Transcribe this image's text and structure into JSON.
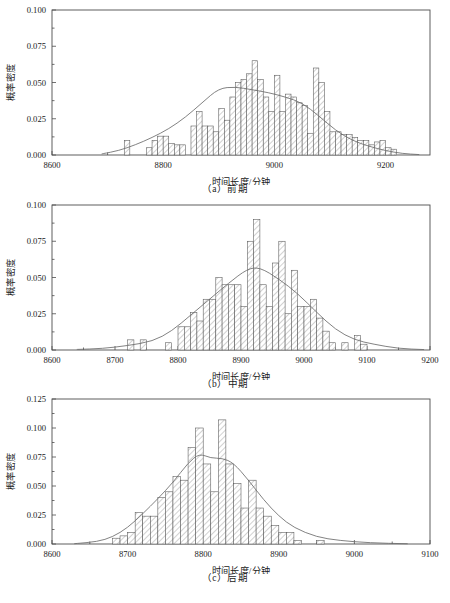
{
  "figure": {
    "background": "#ffffff",
    "line_color": "#4d4d4d",
    "bar_stroke": "#555555",
    "kde_color": "#6b6b6b"
  },
  "chart_data": [
    {
      "type": "bar",
      "id": "panel-a",
      "title": "",
      "caption": "（a）前期",
      "xlabel": "时间长度/分钟",
      "ylabel": "概率密度",
      "xlim": [
        8600,
        9280
      ],
      "ylim": [
        0.0,
        0.1
      ],
      "xticks": [
        8600,
        8800,
        9000,
        9200
      ],
      "xtick_labels": [
        "8600",
        "8800",
        "9000",
        "9200"
      ],
      "yticks": [
        0.0,
        0.025,
        0.05,
        0.075,
        0.1
      ],
      "ytick_labels": [
        "0.000",
        "0.025",
        "0.050",
        "0.075",
        "0.100"
      ],
      "grid": false,
      "legend": null,
      "bin_width": 10,
      "bin_starts": [
        8730,
        8770,
        8780,
        8790,
        8800,
        8810,
        8820,
        8830,
        8850,
        8860,
        8870,
        8880,
        8890,
        8900,
        8910,
        8920,
        8930,
        8940,
        8950,
        8960,
        8970,
        8980,
        8990,
        9000,
        9010,
        9020,
        9030,
        9040,
        9050,
        9060,
        9070,
        9080,
        9090,
        9100,
        9110,
        9120,
        9130,
        9140,
        9150,
        9160,
        9170,
        9180,
        9190,
        9200,
        9210
      ],
      "values": [
        0.01,
        0.005,
        0.01,
        0.013,
        0.013,
        0.008,
        0.007,
        0.007,
        0.02,
        0.03,
        0.02,
        0.02,
        0.016,
        0.032,
        0.024,
        0.04,
        0.05,
        0.052,
        0.056,
        0.065,
        0.052,
        0.04,
        0.03,
        0.055,
        0.03,
        0.042,
        0.04,
        0.036,
        0.034,
        0.015,
        0.06,
        0.05,
        0.03,
        0.016,
        0.016,
        0.014,
        0.014,
        0.012,
        0.01,
        0.01,
        0.007,
        0.009,
        0.01,
        0.005,
        0.004
      ],
      "kde": {
        "x": [
          8690,
          8720,
          8750,
          8780,
          8810,
          8840,
          8870,
          8900,
          8930,
          8960,
          8990,
          9020,
          9050,
          9080,
          9110,
          9140,
          9170,
          9200,
          9230,
          9260
        ],
        "y": [
          0.0008,
          0.003,
          0.007,
          0.012,
          0.018,
          0.026,
          0.036,
          0.046,
          0.047,
          0.045,
          0.043,
          0.04,
          0.036,
          0.027,
          0.017,
          0.01,
          0.006,
          0.003,
          0.001,
          0.0003
        ]
      }
    },
    {
      "type": "bar",
      "id": "panel-b",
      "title": "",
      "caption": "（b）中期",
      "xlabel": "时间长度/分钟",
      "ylabel": "概率密度",
      "xlim": [
        8600,
        9200
      ],
      "ylim": [
        0.0,
        0.1
      ],
      "xticks": [
        8600,
        8700,
        8800,
        8900,
        9000,
        9100,
        9200
      ],
      "xtick_labels": [
        "8600",
        "8700",
        "8800",
        "8900",
        "9000",
        "9100",
        "9200"
      ],
      "yticks": [
        0.0,
        0.025,
        0.05,
        0.075,
        0.1
      ],
      "ytick_labels": [
        "0.000",
        "0.025",
        "0.050",
        "0.075",
        "0.100"
      ],
      "grid": false,
      "legend": null,
      "bin_width": 10,
      "bin_starts": [
        8720,
        8740,
        8780,
        8800,
        8810,
        8820,
        8830,
        8840,
        8850,
        8860,
        8870,
        8880,
        8890,
        8900,
        8910,
        8920,
        8930,
        8940,
        8950,
        8960,
        8970,
        8980,
        8990,
        9000,
        9010,
        9020,
        9030,
        9040,
        9060,
        9080,
        9090
      ],
      "values": [
        0.007,
        0.007,
        0.005,
        0.016,
        0.016,
        0.026,
        0.02,
        0.035,
        0.035,
        0.05,
        0.045,
        0.045,
        0.045,
        0.03,
        0.075,
        0.09,
        0.045,
        0.03,
        0.06,
        0.075,
        0.025,
        0.055,
        0.03,
        0.03,
        0.035,
        0.022,
        0.013,
        0.005,
        0.005,
        0.01,
        0.004
      ],
      "kde": {
        "x": [
          8640,
          8680,
          8720,
          8760,
          8790,
          8820,
          8850,
          8880,
          8910,
          8930,
          8960,
          8990,
          9020,
          9050,
          9080,
          9110,
          9150,
          9190
        ],
        "y": [
          0.0004,
          0.001,
          0.003,
          0.006,
          0.013,
          0.024,
          0.035,
          0.046,
          0.056,
          0.057,
          0.049,
          0.039,
          0.026,
          0.014,
          0.007,
          0.004,
          0.001,
          0.0003
        ]
      }
    },
    {
      "type": "bar",
      "id": "panel-c",
      "title": "",
      "caption": "（c）后期",
      "xlabel": "时间长度/分钟",
      "ylabel": "概率密度",
      "xlim": [
        8600,
        9100
      ],
      "ylim": [
        0.0,
        0.125
      ],
      "xticks": [
        8600,
        8700,
        8800,
        8900,
        9000,
        9100
      ],
      "xtick_labels": [
        "8600",
        "8700",
        "8800",
        "8900",
        "9000",
        "9100"
      ],
      "yticks": [
        0.0,
        0.025,
        0.05,
        0.075,
        0.1,
        0.125
      ],
      "ytick_labels": [
        "0.000",
        "0.025",
        "0.050",
        "0.075",
        "0.100",
        "0.125"
      ],
      "grid": false,
      "legend": null,
      "bin_width": 10,
      "bin_starts": [
        8680,
        8690,
        8700,
        8710,
        8720,
        8730,
        8740,
        8750,
        8760,
        8770,
        8780,
        8790,
        8800,
        8810,
        8820,
        8830,
        8840,
        8850,
        8860,
        8870,
        8880,
        8890,
        8900,
        8910,
        8920,
        8950
      ],
      "values": [
        0.005,
        0.007,
        0.01,
        0.027,
        0.024,
        0.024,
        0.04,
        0.045,
        0.058,
        0.055,
        0.083,
        0.1,
        0.069,
        0.045,
        0.107,
        0.069,
        0.052,
        0.031,
        0.055,
        0.031,
        0.024,
        0.016,
        0.01,
        0.01,
        0.003,
        0.003
      ],
      "kde": {
        "x": [
          8630,
          8660,
          8680,
          8700,
          8720,
          8740,
          8760,
          8780,
          8795,
          8810,
          8825,
          8840,
          8860,
          8880,
          8900,
          8920,
          8950,
          8980,
          9020,
          9070
        ],
        "y": [
          0.0003,
          0.002,
          0.006,
          0.014,
          0.026,
          0.039,
          0.053,
          0.07,
          0.078,
          0.074,
          0.074,
          0.07,
          0.055,
          0.038,
          0.024,
          0.014,
          0.006,
          0.003,
          0.001,
          0.0002
        ]
      }
    }
  ]
}
